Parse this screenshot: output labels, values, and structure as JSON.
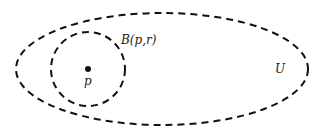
{
  "diagram": {
    "type": "set-illustration",
    "colors": {
      "stroke": "#111111",
      "background": "#ffffff"
    },
    "outer_set": {
      "label": "U",
      "shape": "ellipse",
      "style": "dashed",
      "cx": 162,
      "cy": 69,
      "rx": 146,
      "ry": 56
    },
    "ball": {
      "label": "B(p,r)",
      "shape": "circle",
      "style": "dashed",
      "cx": 88,
      "cy": 69,
      "r": 37
    },
    "point": {
      "label": "p",
      "shape": "dot",
      "cx": 88,
      "cy": 69
    }
  }
}
